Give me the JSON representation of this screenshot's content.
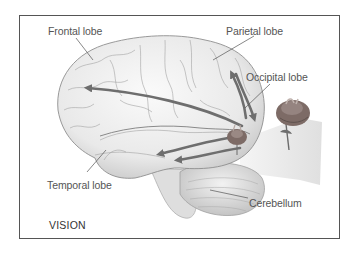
{
  "figure": {
    "title": "VISION",
    "labels": {
      "frontal": "Frontal lobe",
      "parietal": "Parietal lobe",
      "occipital": "Occipital lobe",
      "temporal": "Temporal lobe",
      "cerebellum": "Cerebellum"
    },
    "colors": {
      "frame": "#555555",
      "arrow": "#6e6e6e",
      "brain_fill": "#efefef",
      "brain_stroke": "#9a9a9a",
      "rose": "#7d6b66",
      "label": "#555555"
    }
  }
}
